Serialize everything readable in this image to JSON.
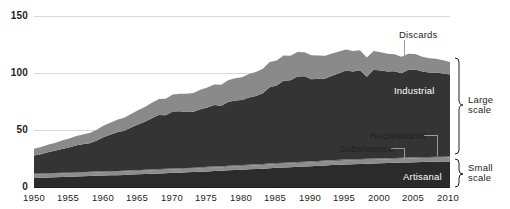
{
  "chart_data": {
    "type": "area",
    "stacked": true,
    "title": "",
    "subtitle": "",
    "xlabel": "",
    "ylabel": "",
    "xlim": [
      1950,
      2010
    ],
    "ylim": [
      0,
      150
    ],
    "grid": true,
    "legend_position": "inline-annotations",
    "yticks": [
      "0",
      "50",
      "100",
      "150"
    ],
    "ytick_values": [
      0,
      50,
      100,
      150
    ],
    "xticks": [
      "1950",
      "1955",
      "1960",
      "1965",
      "1970",
      "1975",
      "1980",
      "1985",
      "1990",
      "1995",
      "2000",
      "2005",
      "2010"
    ],
    "xtick_values": [
      1950,
      1955,
      1960,
      1965,
      1970,
      1975,
      1980,
      1985,
      1990,
      1995,
      2000,
      2005,
      2010
    ],
    "x": [
      1950,
      1951,
      1952,
      1953,
      1954,
      1955,
      1956,
      1957,
      1958,
      1959,
      1960,
      1961,
      1962,
      1963,
      1964,
      1965,
      1966,
      1967,
      1968,
      1969,
      1970,
      1971,
      1972,
      1973,
      1974,
      1975,
      1976,
      1977,
      1978,
      1979,
      1980,
      1981,
      1982,
      1983,
      1984,
      1985,
      1986,
      1987,
      1988,
      1989,
      1990,
      1991,
      1992,
      1993,
      1994,
      1995,
      1996,
      1997,
      1998,
      1999,
      2000,
      2001,
      2002,
      2003,
      2004,
      2005,
      2006,
      2007,
      2008,
      2009,
      2010
    ],
    "series": [
      {
        "name": "Artisanal",
        "color": "#2b2b2b",
        "values": [
          8.0,
          8.2,
          8.4,
          8.6,
          8.8,
          9.0,
          9.2,
          9.4,
          9.6,
          9.8,
          10.0,
          10.2,
          10.4,
          10.6,
          10.9,
          11.1,
          11.4,
          11.6,
          11.9,
          12.1,
          12.4,
          12.6,
          12.9,
          13.1,
          13.4,
          13.7,
          14.0,
          14.3,
          14.6,
          14.9,
          15.2,
          15.5,
          15.8,
          16.1,
          16.5,
          16.8,
          17.1,
          17.4,
          17.7,
          18.0,
          18.3,
          18.6,
          18.9,
          19.2,
          19.5,
          19.8,
          20.0,
          20.2,
          20.4,
          20.6,
          20.8,
          21.0,
          21.2,
          21.4,
          21.6,
          21.8,
          22.0,
          22.1,
          22.2,
          22.3,
          22.4
        ]
      },
      {
        "name": "Subsistence",
        "color": "#8c8c8c",
        "values": [
          3.0,
          3.0,
          3.0,
          3.0,
          3.0,
          3.0,
          3.0,
          3.0,
          3.0,
          3.0,
          3.0,
          3.0,
          3.0,
          3.0,
          3.0,
          3.0,
          3.0,
          3.0,
          3.0,
          3.0,
          3.0,
          3.0,
          3.0,
          3.0,
          3.0,
          3.1,
          3.1,
          3.1,
          3.1,
          3.1,
          3.2,
          3.2,
          3.2,
          3.2,
          3.2,
          3.3,
          3.3,
          3.3,
          3.3,
          3.3,
          3.4,
          3.4,
          3.4,
          3.4,
          3.4,
          3.4,
          3.4,
          3.4,
          3.4,
          3.4,
          3.4,
          3.4,
          3.4,
          3.4,
          3.4,
          3.4,
          3.4,
          3.4,
          3.4,
          3.4,
          3.4
        ]
      },
      {
        "name": "Recreational",
        "color": "#6e6e6e",
        "values": [
          0.6,
          0.6,
          0.6,
          0.6,
          0.6,
          0.6,
          0.6,
          0.6,
          0.7,
          0.7,
          0.7,
          0.7,
          0.7,
          0.7,
          0.7,
          0.7,
          0.8,
          0.8,
          0.8,
          0.8,
          0.8,
          0.8,
          0.8,
          0.8,
          0.9,
          0.9,
          0.9,
          0.9,
          0.9,
          0.9,
          0.9,
          0.9,
          0.9,
          0.9,
          0.9,
          0.9,
          0.9,
          0.9,
          0.9,
          0.9,
          0.9,
          0.9,
          0.9,
          0.9,
          0.9,
          0.9,
          0.9,
          0.9,
          0.9,
          0.9,
          0.9,
          0.9,
          0.9,
          0.9,
          0.9,
          0.9,
          0.9,
          0.9,
          0.9,
          0.9,
          0.9
        ]
      },
      {
        "name": "Industrial",
        "color": "#343434",
        "values": [
          16.0,
          17.0,
          18.5,
          19.5,
          21.0,
          22.0,
          23.5,
          24.5,
          25.0,
          27.0,
          30.0,
          32.0,
          34.0,
          35.0,
          37.5,
          40.0,
          42.0,
          45.0,
          47.5,
          47.0,
          50.0,
          50.0,
          49.0,
          49.0,
          51.0,
          52.0,
          54.0,
          53.0,
          56.0,
          57.0,
          57.0,
          59.0,
          60.0,
          62.0,
          67.0,
          68.0,
          72.0,
          72.0,
          75.0,
          75.0,
          72.0,
          72.0,
          72.0,
          74.0,
          76.0,
          78.0,
          77.0,
          78.0,
          72.0,
          78.0,
          77.0,
          76.0,
          76.0,
          74.0,
          77.0,
          77.0,
          75.0,
          74.0,
          74.0,
          73.0,
          72.0
        ]
      },
      {
        "name": "Discards",
        "color": "#8a8a8a",
        "values": [
          6.0,
          6.3,
          6.6,
          7.0,
          7.4,
          7.8,
          8.2,
          8.6,
          9.0,
          9.5,
          10.0,
          10.5,
          11.0,
          11.5,
          12.0,
          12.5,
          13.0,
          13.5,
          14.0,
          14.5,
          15.0,
          15.5,
          16.0,
          16.5,
          17.0,
          17.5,
          18.0,
          18.5,
          19.0,
          19.5,
          20.0,
          20.5,
          21.0,
          21.5,
          22.0,
          22.0,
          22.0,
          21.5,
          21.5,
          21.0,
          21.0,
          20.5,
          20.0,
          19.5,
          19.0,
          18.5,
          18.0,
          17.5,
          17.0,
          16.5,
          16.0,
          15.5,
          15.0,
          14.5,
          14.0,
          13.5,
          13.0,
          12.5,
          12.0,
          11.5,
          11.0
        ]
      }
    ],
    "annotations": [
      {
        "name": "Discards",
        "label": "Discards"
      },
      {
        "name": "Industrial",
        "label": "Industrial"
      },
      {
        "name": "Recreational",
        "label": "Recreational"
      },
      {
        "name": "Subsistence",
        "label": "Subsistence"
      },
      {
        "name": "Artisanal",
        "label": "Artisanal"
      }
    ],
    "brackets": [
      {
        "label_line1": "Large",
        "label_line2": "scale"
      },
      {
        "label_line1": "Small",
        "label_line2": "scale"
      }
    ]
  },
  "colors": {
    "background": "#ffffff",
    "grid": "#d9d9d9",
    "axis": "#231f20",
    "text": "#231f20",
    "label_light": "#ffffff",
    "discards": "#8a8a8a",
    "industrial": "#343434",
    "recreational": "#6e6e6e",
    "subsistence": "#8c8c8c",
    "artisanal": "#2b2b2b",
    "leader": "#9a9a9a"
  }
}
